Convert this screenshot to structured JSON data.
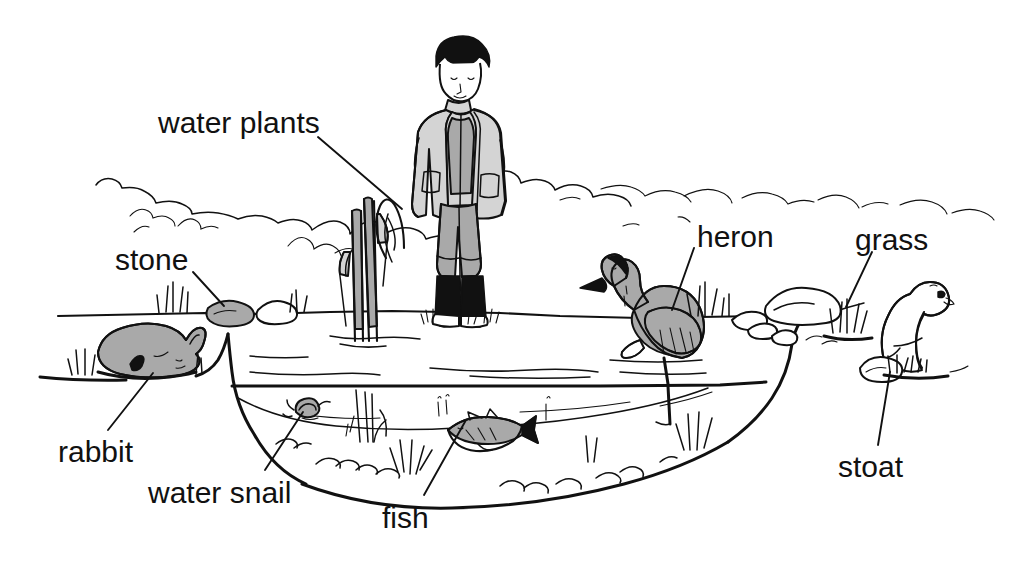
{
  "figure": {
    "style": "black-and-white line drawing with grey shading",
    "background_color": "#ffffff",
    "ink_color": "#111111",
    "shade_color": "#a9a9a9"
  },
  "labels": [
    {
      "id": "water-plants",
      "text": "water plants",
      "x": 158,
      "y": 108,
      "leader": {
        "x1": 318,
        "y1": 137,
        "x2": 402,
        "y2": 209
      }
    },
    {
      "id": "stone",
      "text": "stone",
      "x": 115,
      "y": 245,
      "leader": {
        "x1": 193,
        "y1": 272,
        "x2": 224,
        "y2": 306
      }
    },
    {
      "id": "rabbit",
      "text": "rabbit",
      "x": 58,
      "y": 437,
      "leader": {
        "x1": 108,
        "y1": 430,
        "x2": 153,
        "y2": 373
      }
    },
    {
      "id": "water-snail",
      "text": "water snail",
      "x": 148,
      "y": 478,
      "leader": {
        "x1": 265,
        "y1": 470,
        "x2": 303,
        "y2": 412
      }
    },
    {
      "id": "fish",
      "text": "fish",
      "x": 382,
      "y": 503,
      "leader": {
        "x1": 424,
        "y1": 495,
        "x2": 466,
        "y2": 420
      }
    },
    {
      "id": "heron",
      "text": "heron",
      "x": 697,
      "y": 222,
      "leader": {
        "x1": 694,
        "y1": 248,
        "x2": 672,
        "y2": 310
      }
    },
    {
      "id": "grass",
      "text": "grass",
      "x": 855,
      "y": 225,
      "leader": {
        "x1": 872,
        "y1": 252,
        "x2": 846,
        "y2": 307
      }
    },
    {
      "id": "stoat",
      "text": "stoat",
      "x": 838,
      "y": 452,
      "leader": {
        "x1": 878,
        "y1": 445,
        "x2": 890,
        "y2": 372
      }
    }
  ],
  "scene_items": [
    {
      "name": "person",
      "description": "boy standing on far bank in light jacket, grey trousers and black wellington boots",
      "shaded": true
    },
    {
      "name": "water-plants",
      "description": "tall reeds growing out of the water near the left-centre",
      "shaded": true
    },
    {
      "name": "stone",
      "description": "grey shaded stone on the near bank beside a white stone",
      "shaded": true
    },
    {
      "name": "rabbit",
      "description": "grey shaded rabbit crouching on the left bank",
      "shaded": true
    },
    {
      "name": "water-snail",
      "description": "small snail on the left underwater slope",
      "shaded": false
    },
    {
      "name": "fish",
      "description": "grey shaded fish swimming in mid-water",
      "shaded": true
    },
    {
      "name": "heron",
      "description": "grey shaded heron standing on one leg in shallow water",
      "shaded": true
    },
    {
      "name": "grass",
      "description": "tufts of grass on the right bank beside the boulders",
      "shaded": false
    },
    {
      "name": "stoat",
      "description": "white stoat sitting upright on the right bank",
      "shaded": false
    },
    {
      "name": "pond-water",
      "description": "pond with water surface line and sloping bottom",
      "shaded": false
    },
    {
      "name": "background-hedge",
      "description": "sketchy distant hedgerow along the horizon",
      "shaded": false
    }
  ]
}
